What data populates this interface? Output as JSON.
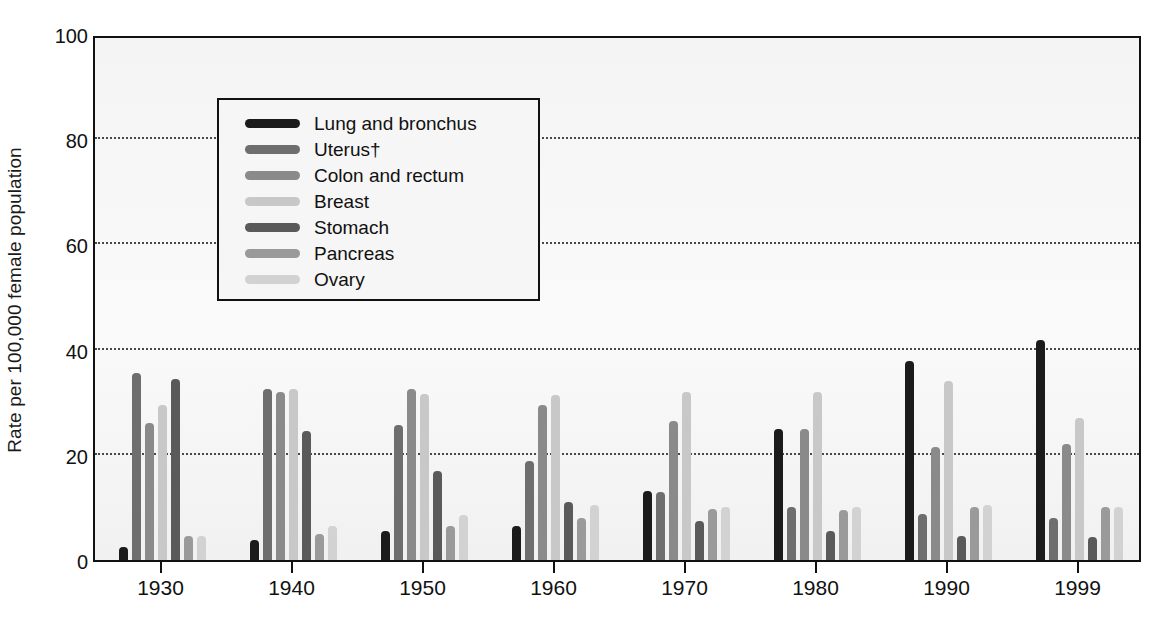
{
  "chart_data": {
    "type": "bar",
    "title": "",
    "xlabel": "",
    "ylabel": "Rate per 100,000 female population",
    "ylim": [
      0,
      100
    ],
    "yticks": [
      0,
      20,
      40,
      60,
      80,
      100
    ],
    "grid": "horizontal dotted gridlines at 20, 40, 60, 80",
    "legend_position": "upper-left inside plot",
    "categories": [
      "1930",
      "1940",
      "1950",
      "1960",
      "1970",
      "1980",
      "1990",
      "1999"
    ],
    "series": [
      {
        "name": "Lung and bronchus",
        "color": "#1b1b1b",
        "values": [
          2.5,
          3.8,
          5.5,
          6.5,
          13.2,
          25.0,
          37.8,
          41.8
        ]
      },
      {
        "name": "Uterus†",
        "color": "#6e6e6e",
        "values": [
          35.5,
          32.5,
          25.7,
          18.8,
          13.0,
          10.0,
          8.8,
          8.0
        ]
      },
      {
        "name": "Colon and rectum",
        "color": "#8a8a8a",
        "values": [
          26.0,
          32.0,
          32.5,
          29.5,
          26.5,
          25.0,
          21.5,
          22.0
        ]
      },
      {
        "name": "Breast",
        "color": "#c8c8c8",
        "values": [
          29.5,
          32.5,
          31.5,
          31.3,
          32.0,
          32.0,
          34.0,
          27.0
        ]
      },
      {
        "name": "Stomach",
        "color": "#5a5a5a",
        "values": [
          34.5,
          24.5,
          17.0,
          11.0,
          7.5,
          5.5,
          4.5,
          4.3
        ]
      },
      {
        "name": "Pancreas",
        "color": "#9a9a9a",
        "values": [
          4.5,
          5.0,
          6.5,
          8.0,
          9.7,
          9.5,
          10.0,
          10.0
        ]
      },
      {
        "name": "Ovary",
        "color": "#d2d2d2",
        "values": [
          4.5,
          6.5,
          8.5,
          10.5,
          10.0,
          10.0,
          10.5,
          10.0
        ]
      }
    ]
  },
  "axis": {
    "ylabel": "Rate per 100,000 female population",
    "ytick_labels": [
      "100",
      "80",
      "60",
      "40",
      "20",
      "0"
    ]
  },
  "legend": {
    "items": [
      "Lung and bronchus",
      "Uterus†",
      "Colon and rectum",
      "Breast",
      "Stomach",
      "Pancreas",
      "Ovary"
    ]
  }
}
